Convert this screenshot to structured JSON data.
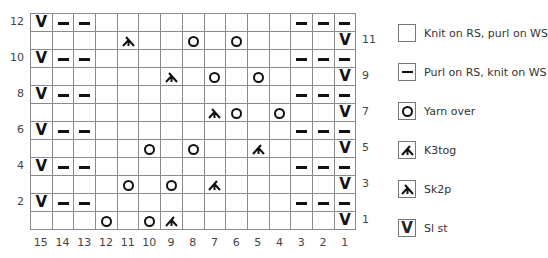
{
  "chart_data": {
    "type": "table",
    "columns": [
      15,
      14,
      13,
      12,
      11,
      10,
      9,
      8,
      7,
      6,
      5,
      4,
      3,
      2,
      1
    ],
    "rows_top_to_bottom": [
      {
        "row": 12,
        "cells": [
          "sl",
          "p",
          "p",
          "k",
          "k",
          "k",
          "k",
          "k",
          "k",
          "k",
          "k",
          "k",
          "p",
          "p",
          "p"
        ]
      },
      {
        "row": 11,
        "cells": [
          "k",
          "k",
          "k",
          "k",
          "sk2p",
          "k",
          "k",
          "yo",
          "k",
          "yo",
          "k",
          "k",
          "k",
          "k",
          "sl"
        ]
      },
      {
        "row": 10,
        "cells": [
          "sl",
          "p",
          "p",
          "k",
          "k",
          "k",
          "k",
          "k",
          "k",
          "k",
          "k",
          "k",
          "p",
          "p",
          "p"
        ]
      },
      {
        "row": 9,
        "cells": [
          "k",
          "k",
          "k",
          "k",
          "k",
          "k",
          "sk2p",
          "k",
          "yo",
          "k",
          "yo",
          "k",
          "k",
          "k",
          "sl"
        ]
      },
      {
        "row": 8,
        "cells": [
          "sl",
          "p",
          "p",
          "k",
          "k",
          "k",
          "k",
          "k",
          "k",
          "k",
          "k",
          "k",
          "p",
          "p",
          "p"
        ]
      },
      {
        "row": 7,
        "cells": [
          "k",
          "k",
          "k",
          "k",
          "k",
          "k",
          "k",
          "k",
          "sk2p",
          "yo",
          "k",
          "yo",
          "k",
          "k",
          "sl"
        ]
      },
      {
        "row": 6,
        "cells": [
          "sl",
          "p",
          "p",
          "k",
          "k",
          "k",
          "k",
          "k",
          "k",
          "k",
          "k",
          "k",
          "p",
          "p",
          "p"
        ]
      },
      {
        "row": 5,
        "cells": [
          "k",
          "k",
          "k",
          "k",
          "k",
          "yo",
          "k",
          "yo",
          "k",
          "k",
          "k3tog",
          "k",
          "k",
          "k",
          "sl"
        ]
      },
      {
        "row": 4,
        "cells": [
          "sl",
          "p",
          "p",
          "k",
          "k",
          "k",
          "k",
          "k",
          "k",
          "k",
          "k",
          "k",
          "p",
          "p",
          "p"
        ]
      },
      {
        "row": 3,
        "cells": [
          "k",
          "k",
          "k",
          "k",
          "yo",
          "k",
          "yo",
          "k",
          "k3tog",
          "k",
          "k",
          "k",
          "k",
          "k",
          "sl"
        ]
      },
      {
        "row": 2,
        "cells": [
          "sl",
          "p",
          "p",
          "k",
          "k",
          "k",
          "k",
          "k",
          "k",
          "k",
          "k",
          "k",
          "p",
          "p",
          "p"
        ]
      },
      {
        "row": 1,
        "cells": [
          "k",
          "k",
          "k",
          "yo",
          "k",
          "yo",
          "k3tog",
          "k",
          "k",
          "k",
          "k",
          "k",
          "k",
          "k",
          "sl"
        ]
      }
    ],
    "left_row_labels": [
      "12",
      "10",
      "8",
      "6",
      "4",
      "2"
    ],
    "right_row_labels": [
      "11",
      "9",
      "7",
      "5",
      "3",
      "1"
    ],
    "column_labels": [
      "15",
      "14",
      "13",
      "12",
      "11",
      "10",
      "9",
      "8",
      "7",
      "6",
      "5",
      "4",
      "3",
      "2",
      "1"
    ]
  },
  "legend": [
    {
      "symbol": "k",
      "icon": "empty-box-icon",
      "label": "Knit on RS, purl on WS"
    },
    {
      "symbol": "p",
      "icon": "dash-icon",
      "label": "Purl on RS, knit on WS"
    },
    {
      "symbol": "yo",
      "icon": "circle-icon",
      "label": "Yarn over"
    },
    {
      "symbol": "k3tog",
      "icon": "k3tog-icon",
      "label": "K3tog"
    },
    {
      "symbol": "sk2p",
      "icon": "sk2p-icon",
      "label": "Sk2p"
    },
    {
      "symbol": "sl",
      "icon": "v-icon",
      "label": "Sl st"
    }
  ],
  "symbols": {
    "sl": "V"
  }
}
